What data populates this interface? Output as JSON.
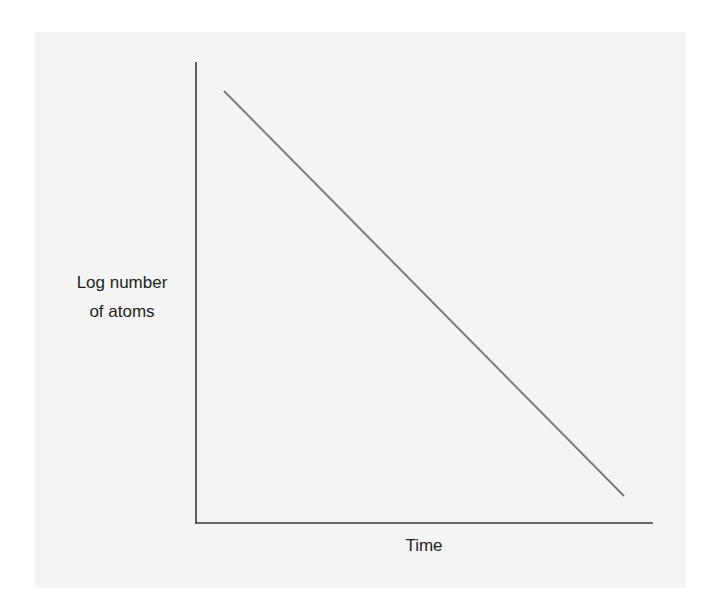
{
  "chart_data": {
    "type": "line",
    "title": "",
    "xlabel": "Time",
    "ylabel_lines": [
      "Log number",
      "of atoms"
    ],
    "ylabel": "Log number of atoms",
    "x": [
      0,
      1
    ],
    "series": [
      {
        "name": "Log number of atoms",
        "values": [
          1,
          0
        ],
        "color": "#7a7a7a"
      }
    ],
    "axes_color": "#3a3a3a",
    "background": "#f4f4f4",
    "grid": false,
    "legend": "none",
    "ticks": "none"
  }
}
